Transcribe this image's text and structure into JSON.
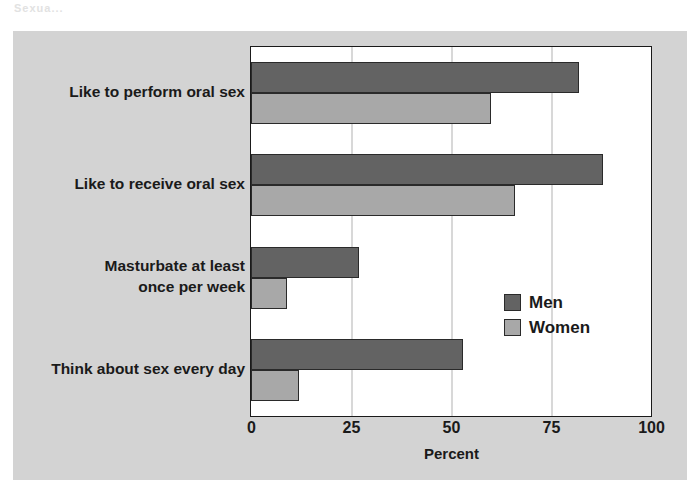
{
  "scan": {
    "artifact_text": "Sexua..."
  },
  "chart_data": {
    "type": "bar",
    "orientation": "horizontal",
    "title": "",
    "subtitle": "",
    "xlabel": "Percent",
    "ylabel": "",
    "xlim": [
      0,
      100
    ],
    "xticks": [
      0,
      25,
      50,
      75,
      100
    ],
    "xtick_labels": [
      "0",
      "25",
      "50",
      "75",
      "100"
    ],
    "grid": "vertical",
    "legend_position": "inside-right-lower",
    "categories": [
      "Like to perform oral sex",
      "Like to receive oral sex",
      "Masturbate at least\nonce per week",
      "Think about sex every day"
    ],
    "category_lines": [
      [
        "Like to perform oral sex"
      ],
      [
        "Like to receive oral sex"
      ],
      [
        "Masturbate at least",
        "once per week"
      ],
      [
        "Think about sex every day"
      ]
    ],
    "series": [
      {
        "name": "Men",
        "color": "#636363",
        "values": [
          82,
          88,
          27,
          53
        ]
      },
      {
        "name": "Women",
        "color": "#a8a8a8",
        "values": [
          60,
          66,
          9,
          12
        ]
      }
    ]
  },
  "legend": {
    "items": [
      {
        "label": "Men",
        "color": "#636363"
      },
      {
        "label": "Women",
        "color": "#a8a8a8"
      }
    ]
  },
  "colors": {
    "panel_background": "#d3d3d3",
    "plot_background": "#ffffff",
    "axis_line": "#1a1a1a",
    "gridline": "#d8d8d8",
    "men_bar": "#636363",
    "women_bar": "#a8a8a8",
    "text": "#1a1a1a"
  }
}
